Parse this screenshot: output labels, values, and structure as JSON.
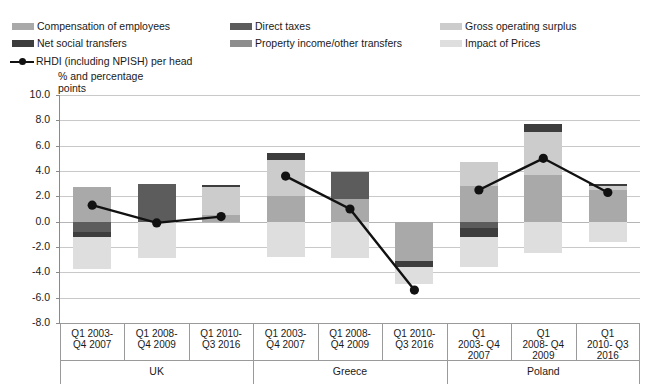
{
  "legend": {
    "items": [
      {
        "label": "Compensation of employees",
        "color": "#a9a9a9",
        "col": 0,
        "row": 0
      },
      {
        "label": "Direct taxes",
        "color": "#5c5c5c",
        "col": 1,
        "row": 0
      },
      {
        "label": "Gross operating surplus",
        "color": "#cccccc",
        "col": 2,
        "row": 0
      },
      {
        "label": "Net social transfers",
        "color": "#3d3d3d",
        "col": 0,
        "row": 1
      },
      {
        "label": "Property income/other transfers",
        "color": "#8d8d8d",
        "col": 1,
        "row": 1
      },
      {
        "label": "Impact of Prices",
        "color": "#dedede",
        "col": 2,
        "row": 1
      }
    ],
    "series_label": "RHDI  (including NPISH)  per head",
    "series_color": "#111111"
  },
  "axis_title": "% and percentage\npoints",
  "chart_data": {
    "type": "bar",
    "title": "",
    "subtitle": "",
    "xlabel": "",
    "ylabel": "% and percentage points",
    "ylim": [
      -8.0,
      10.0
    ],
    "ytick_step": 2.0,
    "yticks": [
      "10.0",
      "8.0",
      "6.0",
      "4.0",
      "2.0",
      "0.0",
      "-2.0",
      "-4.0",
      "-6.0",
      "-8.0"
    ],
    "grid": true,
    "stacked": true,
    "legend_position": "top",
    "groups": [
      {
        "name": "UK",
        "categories": [
          "Q1 2003-\nQ4 2007",
          "Q1 2008-\nQ4 2009",
          "Q1 2010-\nQ3 2016"
        ]
      },
      {
        "name": "Greece",
        "categories": [
          "Q1 2003-\nQ4 2007",
          "Q1 2008-\nQ4 2009",
          "Q1 2010-\nQ3 2016"
        ]
      },
      {
        "name": "Poland",
        "categories": [
          "Q1\n2003- Q4\n2007",
          "Q1\n2008- Q4\n2009",
          "Q1\n2010- Q3\n2016"
        ]
      }
    ],
    "categories": [
      "UK Q1 2003-Q4 2007",
      "UK Q1 2008-Q4 2009",
      "UK Q1 2010-Q3 2016",
      "Greece Q1 2003-Q4 2007",
      "Greece Q1 2008-Q4 2009",
      "Greece Q1 2010-Q3 2016",
      "Poland Q1 2003-Q4 2007",
      "Poland Q1 2008-Q4 2009",
      "Poland Q1 2010-Q3 2016"
    ],
    "series": [
      {
        "name": "Compensation of employees",
        "color": "#a9a9a9",
        "values": [
          2.7,
          0.0,
          0.5,
          2.0,
          1.8,
          -3.1,
          2.8,
          3.7,
          2.5
        ]
      },
      {
        "name": "Direct taxes",
        "color": "#5c5c5c",
        "values": [
          -0.8,
          3.0,
          0.0,
          0.0,
          2.1,
          0.0,
          -0.5,
          0.0,
          0.0
        ]
      },
      {
        "name": "Gross operating surplus",
        "color": "#cccccc",
        "values": [
          0.0,
          0.0,
          2.2,
          2.9,
          0.0,
          0.0,
          1.9,
          3.4,
          0.3
        ]
      },
      {
        "name": "Net social transfers",
        "color": "#3d3d3d",
        "values": [
          -0.4,
          0.0,
          0.2,
          0.5,
          0.0,
          -0.5,
          -0.7,
          0.6,
          0.2
        ]
      },
      {
        "name": "Property income/other transfers",
        "color": "#8d8d8d",
        "values": [
          0.0,
          0.0,
          0.0,
          0.0,
          0.0,
          0.0,
          0.0,
          0.0,
          0.0
        ]
      },
      {
        "name": "Impact of Prices",
        "color": "#dedede",
        "values": [
          -2.5,
          -2.9,
          0.0,
          -2.8,
          -2.9,
          -1.3,
          -2.4,
          -2.5,
          -1.6
        ]
      }
    ],
    "line_series": {
      "name": "RHDI  (including NPISH)  per head",
      "color": "#111111",
      "marker": "circle",
      "values": [
        1.3,
        -0.1,
        0.4,
        3.6,
        1.0,
        -5.4,
        2.5,
        5.0,
        2.3
      ]
    }
  }
}
